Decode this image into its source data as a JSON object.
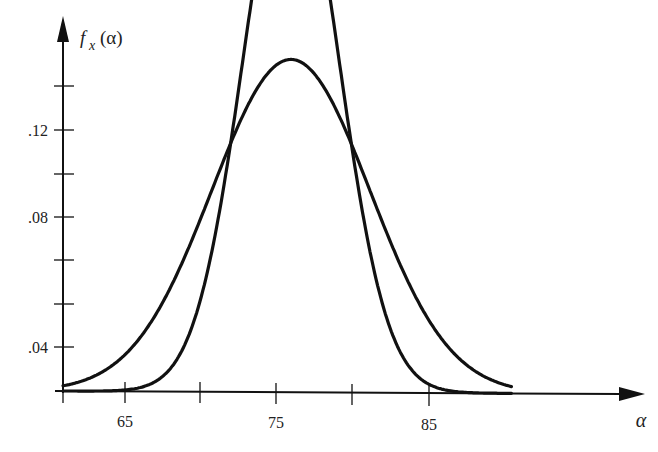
{
  "chart_data": {
    "type": "line",
    "title": "",
    "xlabel": "α",
    "ylabel": "f_x(α)",
    "xlim": [
      60,
      90
    ],
    "ylim": [
      0,
      0.14
    ],
    "x_ticks": [
      60,
      65,
      70,
      75,
      80,
      85
    ],
    "x_tick_labels": [
      "",
      "65",
      "",
      "75",
      "",
      "85"
    ],
    "y_ticks": [
      0.04,
      0.05,
      0.06,
      0.07,
      0.08,
      0.09,
      0.1,
      0.11,
      0.12,
      0.13
    ],
    "y_tick_labels": {
      "0.04": ".04",
      "0.08": ".08",
      "0.12": ".12"
    },
    "grid": false,
    "legend": null,
    "series": [
      {
        "name": "narrow normal density",
        "distribution": "normal",
        "mean": 75,
        "std": 3.15,
        "peak": 0.1265,
        "x": [
          60,
          66,
          68,
          70,
          72,
          73,
          74,
          75,
          76,
          77,
          78,
          80,
          82,
          84,
          90
        ],
        "values": [
          0.0,
          0.0022,
          0.0107,
          0.036,
          0.0805,
          0.1033,
          0.1201,
          0.1265,
          0.1201,
          0.1033,
          0.0805,
          0.036,
          0.0107,
          0.0022,
          0.0
        ]
      },
      {
        "name": "wide normal density",
        "distribution": "normal",
        "mean": 75,
        "std": 5.2,
        "peak": 0.0765,
        "x": [
          60,
          63,
          65,
          67,
          69,
          71,
          73,
          75,
          77,
          79,
          81,
          83,
          85,
          87,
          90
        ],
        "values": [
          0.0012,
          0.005,
          0.0121,
          0.0235,
          0.0393,
          0.0568,
          0.0712,
          0.0765,
          0.0712,
          0.0568,
          0.0393,
          0.0235,
          0.0121,
          0.005,
          0.0012
        ]
      }
    ],
    "annotations": []
  },
  "labels": {
    "y_axis_f": "f",
    "y_axis_sub": "x",
    "y_axis_arg": "(α)",
    "x_axis": "α",
    "x65": "65",
    "x75": "75",
    "x85": "85",
    "y04": ".04",
    "y08": ".08",
    "y12": ".12"
  }
}
